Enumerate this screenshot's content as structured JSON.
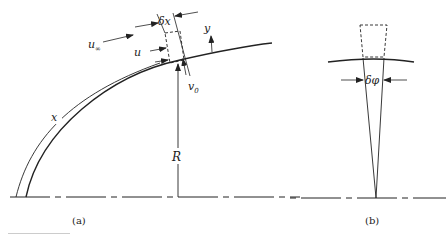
{
  "figure": {
    "panels": [
      {
        "id": "a",
        "caption": "(a)",
        "labels": {
          "u_inf": "u",
          "u_inf_sub": "∞",
          "u": "u",
          "delta_x": "δx",
          "y": "y",
          "v0": "v",
          "v0_sub": "0",
          "x": "x",
          "R": "R"
        }
      },
      {
        "id": "b",
        "caption": "(b)",
        "labels": {
          "delta_phi": "δφ"
        }
      }
    ],
    "colors": {
      "stroke": "#222222",
      "background": "#ffffff"
    }
  }
}
